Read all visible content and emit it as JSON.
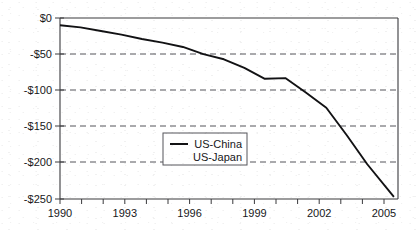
{
  "chart_data": {
    "type": "line",
    "title": "",
    "subtitle": "",
    "xlabel": "",
    "ylabel": "",
    "xlim": [
      1990,
      2006.5
    ],
    "ylim": [
      -250,
      0
    ],
    "grid": true,
    "grid_axis": "y",
    "legend_position": "center",
    "x_ticks": [
      1990,
      1993,
      1996,
      1999,
      2002,
      2005
    ],
    "x_tick_labels": [
      "1990",
      "1993",
      "1996",
      "1999",
      "2002",
      "2005"
    ],
    "y_ticks": [
      0,
      -50,
      -100,
      -150,
      -200,
      -250
    ],
    "y_tick_labels": [
      "$0",
      "-$50",
      "-$100",
      "-$150",
      "-$200",
      "-$250"
    ],
    "legend_entries": [
      "US-China",
      "US-Japan"
    ],
    "series": [
      {
        "name": "US-China",
        "x": [
          1990,
          1991,
          1992,
          1993,
          1994,
          1995,
          1996,
          1997,
          1998,
          1999,
          2000,
          2001,
          2002,
          2003,
          2004,
          2005,
          2006.3
        ],
        "values": [
          -10,
          -13,
          -18,
          -23,
          -29,
          -34,
          -40,
          -50,
          -57,
          -69,
          -84,
          -83,
          -103,
          -124,
          -162,
          -202,
          -247
        ]
      },
      {
        "name": "US-Japan",
        "x": [],
        "values": []
      }
    ]
  },
  "axes": {
    "y_axis_name": "trade-balance-axis",
    "x_axis_name": "year-axis"
  }
}
